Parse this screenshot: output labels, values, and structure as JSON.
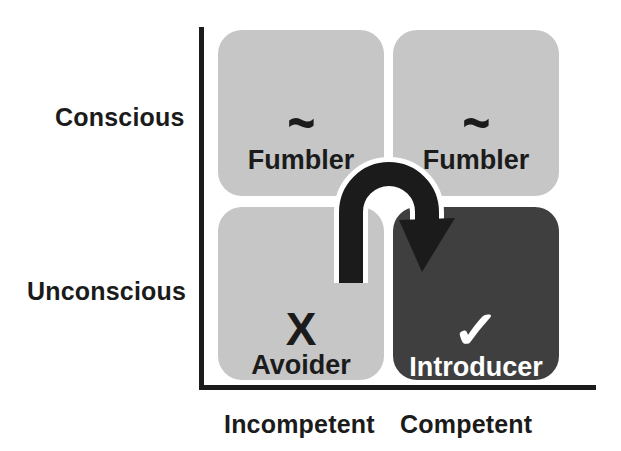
{
  "diagram": {
    "colors": {
      "background": "#ffffff",
      "axis": "#1b1b1b",
      "quadrant_light": "#c6c6c6",
      "quadrant_dark": "#3f3f3f",
      "text_dark": "#1b1b1b",
      "text_light": "#ffffff",
      "arrow": "#1b1b1b"
    },
    "y_axis": {
      "name": "consciousness-axis",
      "labels": {
        "top": "Conscious",
        "bottom": "Unconscious"
      }
    },
    "x_axis": {
      "name": "competence-axis",
      "labels": {
        "left": "Incompetent",
        "right": "Competent"
      }
    },
    "quadrants": [
      {
        "id": "conscious-incompetent",
        "row": "Conscious",
        "column": "Incompetent",
        "glyph": "~",
        "glyph_name": "tilde-icon",
        "label": "Fumbler",
        "style": "light"
      },
      {
        "id": "conscious-competent",
        "row": "Conscious",
        "column": "Competent",
        "glyph": "~",
        "glyph_name": "tilde-icon",
        "label": "Fumbler",
        "style": "light"
      },
      {
        "id": "unconscious-incompetent",
        "row": "Unconscious",
        "column": "Incompetent",
        "glyph": "X",
        "glyph_name": "x-mark-icon",
        "label": "Avoider",
        "style": "light"
      },
      {
        "id": "unconscious-competent",
        "row": "Unconscious",
        "column": "Competent",
        "glyph": "✓",
        "glyph_name": "check-mark-icon",
        "label": "Introducer",
        "style": "dark"
      }
    ],
    "arrow": {
      "name": "u-turn-arrow",
      "from_quadrant": "unconscious-incompetent",
      "to_quadrant": "unconscious-competent",
      "shape": "u-turn-hook",
      "direction": "down-right"
    }
  }
}
